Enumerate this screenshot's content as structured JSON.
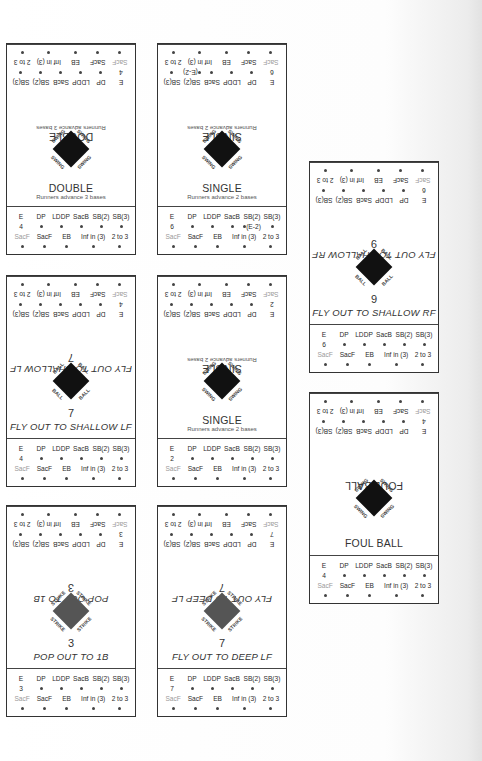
{
  "stat_headers_row1": [
    "E",
    "DP",
    "LDDP",
    "SacB",
    "SB(2)",
    "SB(3)"
  ],
  "stat_headers_row2": [
    "SacF",
    "SacF",
    "EB",
    "Inf in (3)",
    "2 to 3"
  ],
  "cards": [
    {
      "id": "double",
      "title": "DOUBLE",
      "number": "",
      "subtitle": "Runners advance 3 bases",
      "diamond_label": "SWING",
      "diamond_color": "#111111",
      "e_value": "4",
      "sb2_note": ""
    },
    {
      "id": "single-1",
      "title": "SINGLE",
      "number": "",
      "subtitle": "Runners advance 2 bases",
      "diamond_label": "SWING",
      "diamond_color": "#111111",
      "e_value": "6",
      "sb2_note": "(E-2)"
    },
    {
      "id": "fly-shallow-rf",
      "title": "FLY OUT TO SHALLOW RF",
      "number": "9",
      "subtitle": "",
      "diamond_label": "BALL",
      "diamond_color": "#111111",
      "e_value": "6",
      "sb2_note": ""
    },
    {
      "id": "fly-shallow-lf",
      "title": "FLY OUT TO SHALLOW LF",
      "number": "7",
      "subtitle": "",
      "diamond_label": "BALL",
      "diamond_color": "#111111",
      "e_value": "4",
      "sb2_note": ""
    },
    {
      "id": "single-2",
      "title": "SINGLE",
      "number": "",
      "subtitle": "Runners advance 2 bases",
      "diamond_label": "SWING",
      "diamond_color": "#111111",
      "e_value": "2",
      "sb2_note": ""
    },
    {
      "id": "foul-ball",
      "title": "FOUL BALL",
      "number": "",
      "subtitle": "",
      "diamond_label": "SWING",
      "diamond_color": "#111111",
      "e_value": "4",
      "sb2_note": ""
    },
    {
      "id": "pop-1b",
      "title": "POP OUT TO 1B",
      "number": "3",
      "subtitle": "",
      "diamond_label": "STRIKE",
      "diamond_color": "#555555",
      "e_value": "3",
      "sb2_note": ""
    },
    {
      "id": "fly-deep-lf",
      "title": "FLY OUT TO DEEP LF",
      "number": "7",
      "subtitle": "",
      "diamond_label": "STRIKE",
      "diamond_color": "#555555",
      "e_value": "7",
      "sb2_note": ""
    }
  ]
}
